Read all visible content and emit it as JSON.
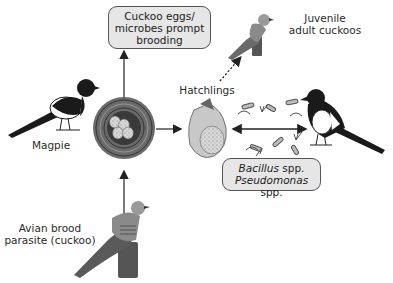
{
  "labels": {
    "top_box": [
      "Cuckoo eggs/",
      "microbes prompt",
      "brooding"
    ],
    "juvenile": [
      "Juvenile",
      "adult cuckoos"
    ],
    "hatchlings": "Hatchlings",
    "magpie": "Magpie",
    "parasite": [
      "Avian brood",
      "parasite (cuckoo)"
    ],
    "bacteria_box": {
      "line1_italic": "Bacillus",
      "line1_rest": " spp.",
      "line2_italic": "Pseudomonas",
      "line2_rest": " spp."
    }
  },
  "colors": {
    "box_fill": "#e6e6e6",
    "arrow": "#222222",
    "bird_dark": "#1a1a1a",
    "cuckoo_grey": "#7a7a7a"
  }
}
